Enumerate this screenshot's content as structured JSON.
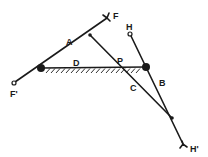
{
  "diagram": {
    "type": "linkage-mechanism",
    "colors": {
      "line": "#1a1a1a",
      "background": "#ffffff"
    },
    "labels": {
      "A": "A",
      "B": "B",
      "C": "C",
      "D": "D",
      "P": "P",
      "F": "F",
      "F_prime": "F'",
      "H": "H",
      "H_prime": "H'"
    },
    "points": {
      "left_pivot": [
        41,
        68
      ],
      "right_pivot": [
        146,
        67
      ],
      "joint_A_C": [
        90,
        35
      ],
      "joint_B_C": [
        172,
        118
      ],
      "F_end": [
        110,
        16
      ],
      "F_prime_end": [
        13,
        83
      ],
      "H_end": [
        130,
        33
      ],
      "H_prime_end": [
        184,
        146
      ]
    },
    "links": [
      {
        "name": "A",
        "from": "F_prime_end",
        "to": "F_end"
      },
      {
        "name": "B",
        "from": "H_end",
        "to": "H_prime_end"
      },
      {
        "name": "C",
        "from": "joint_A_C",
        "to": "joint_B_C"
      },
      {
        "name": "D",
        "from": "left_pivot",
        "to": "right_pivot",
        "ground": true
      }
    ]
  }
}
